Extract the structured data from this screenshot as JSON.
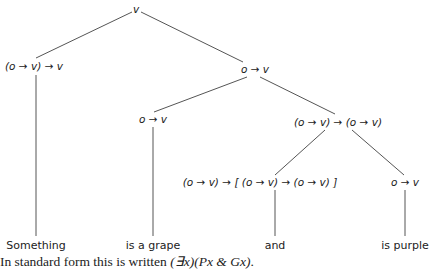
{
  "tree": {
    "root": {
      "label": "v"
    },
    "left_functor": {
      "label": "(o → v) → v"
    },
    "right_predicate": {
      "label": "o → v"
    },
    "grape_predicate": {
      "label": "o → v"
    },
    "conj_applied": {
      "label": "(o → v) → (o → v)"
    },
    "conj_type": {
      "label": "(o → v) → [ (o → v) → (o → v) ]"
    },
    "purple_predicate": {
      "label": "o → v"
    }
  },
  "leaves": {
    "something": "Something",
    "grape": "is a grape",
    "and": "and",
    "purple": "is purple"
  },
  "caption": {
    "prefix": "In standard form this is written ",
    "formula": "(∃x)(Px & Gx)",
    "suffix": "."
  }
}
